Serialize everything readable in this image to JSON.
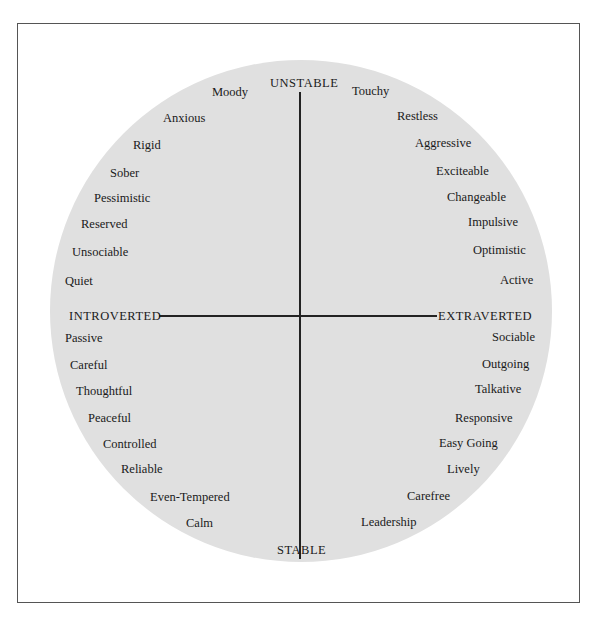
{
  "diagram": {
    "axes": {
      "top": "UNSTABLE",
      "bottom": "STABLE",
      "left": "INTROVERTED",
      "right": "EXTRAVERTED"
    },
    "quadrants": {
      "unstable_introverted": [
        "Moody",
        "Anxious",
        "Rigid",
        "Sober",
        "Pessimistic",
        "Reserved",
        "Unsociable",
        "Quiet"
      ],
      "unstable_extraverted": [
        "Touchy",
        "Restless",
        "Aggressive",
        "Exciteable",
        "Changeable",
        "Impulsive",
        "Optimistic",
        "Active"
      ],
      "stable_introverted": [
        "Passive",
        "Careful",
        "Thoughtful",
        "Peaceful",
        "Controlled",
        "Reliable",
        "Even-Tempered",
        "Calm"
      ],
      "stable_extraverted": [
        "Sociable",
        "Outgoing",
        "Talkative",
        "Responsive",
        "Easy Going",
        "Lively",
        "Carefree",
        "Leadership"
      ]
    },
    "colors": {
      "circle_fill": "#e0e0e0",
      "axis_line": "#222222",
      "frame_border": "#555555"
    }
  }
}
